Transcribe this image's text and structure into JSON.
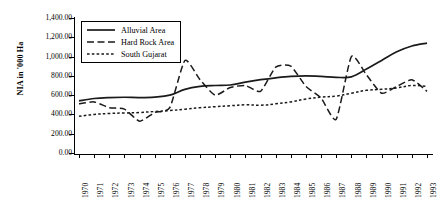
{
  "chart_data": {
    "type": "line",
    "title": "",
    "xlabel": "",
    "ylabel": "NIA in '000 Ha",
    "ylim": [
      0,
      1400
    ],
    "ytick_step": 200,
    "ytick_labels": [
      "1,400.00",
      "1,200.00",
      "1,000.00",
      "800.00",
      "600.00",
      "400.00",
      "200.00",
      "0.00"
    ],
    "ytick_values": [
      1400,
      1200,
      1000,
      800,
      600,
      400,
      200,
      0
    ],
    "grid": false,
    "legend_position": "top-left-inside",
    "x": [
      1970,
      1971,
      1972,
      1973,
      1974,
      1975,
      1976,
      1977,
      1978,
      1979,
      1980,
      1981,
      1982,
      1983,
      1984,
      1985,
      1986,
      1987,
      1988,
      1989,
      1990,
      1991,
      1992,
      1993
    ],
    "categories": [
      "1970",
      "1971",
      "1972",
      "1973",
      "1974",
      "1975",
      "1976",
      "1977",
      "1978",
      "1979",
      "1980",
      "1981",
      "1982",
      "1983",
      "1984",
      "1985",
      "1986",
      "1987",
      "1988",
      "1989",
      "1990",
      "1991",
      "1992",
      "1993"
    ],
    "series": [
      {
        "name": "Alluvial Area",
        "style": "solid",
        "color": "#1a1a1a",
        "values": [
          540,
          565,
          575,
          578,
          575,
          580,
          600,
          660,
          690,
          700,
          705,
          735,
          760,
          780,
          795,
          800,
          795,
          785,
          790,
          870,
          960,
          1050,
          1110,
          1140
        ]
      },
      {
        "name": "Hard Rock Area",
        "style": "dashed",
        "color": "#1a1a1a",
        "values": [
          510,
          530,
          470,
          455,
          330,
          420,
          470,
          960,
          760,
          600,
          680,
          700,
          640,
          890,
          900,
          690,
          570,
          350,
          1000,
          810,
          620,
          690,
          760,
          640
        ]
      },
      {
        "name": "South Gujarat",
        "style": "dotted",
        "color": "#1a1a1a",
        "values": [
          380,
          400,
          410,
          415,
          420,
          430,
          440,
          455,
          470,
          480,
          490,
          500,
          495,
          510,
          530,
          560,
          580,
          590,
          620,
          650,
          660,
          675,
          700,
          690
        ]
      }
    ]
  },
  "legend": {
    "items": [
      {
        "label": "Alluvial Area",
        "style": "solid"
      },
      {
        "label": "Hard Rock Area",
        "style": "dashed"
      },
      {
        "label": "South Gujarat",
        "style": "dotted"
      }
    ]
  }
}
